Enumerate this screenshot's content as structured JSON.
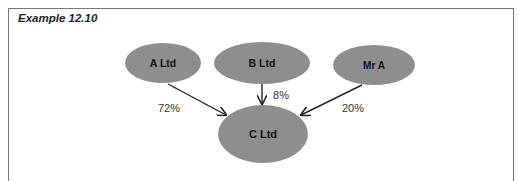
{
  "title": "Example 12.10",
  "colors": {
    "node_fill": "#8e8e8e",
    "arrow": "#222222",
    "frame": "#777777"
  },
  "nodes": [
    {
      "id": "a_ltd",
      "label": "A Ltd",
      "cx": 163,
      "cy": 63,
      "rx": 38,
      "ry": 20
    },
    {
      "id": "b_ltd",
      "label": "B Ltd",
      "cx": 262,
      "cy": 63,
      "rx": 48,
      "ry": 21
    },
    {
      "id": "mr_a",
      "label": "Mr A",
      "cx": 374,
      "cy": 65,
      "rx": 41,
      "ry": 20
    },
    {
      "id": "c_ltd",
      "label": "C Ltd",
      "cx": 263,
      "cy": 134,
      "rx": 45,
      "ry": 29
    }
  ],
  "edges": [
    {
      "from": "a_ltd",
      "to": "c_ltd",
      "label": "72%"
    },
    {
      "from": "b_ltd",
      "to": "c_ltd",
      "label": "8%"
    },
    {
      "from": "mr_a",
      "to": "c_ltd",
      "label": "20%"
    }
  ]
}
